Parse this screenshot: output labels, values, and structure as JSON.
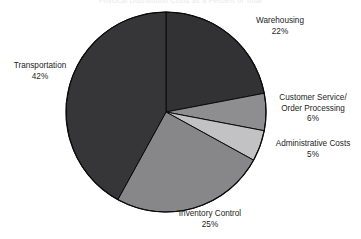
{
  "chart_data": {
    "type": "pie",
    "title": "Physical Distribution Costs as a Percent of Total",
    "xlabel": "",
    "ylabel": "",
    "legend_position": "none",
    "grid": false,
    "start_angle_deg": 0,
    "direction": "clockwise",
    "categories": [
      "Warehousing",
      "Customer Service/ Order Processing",
      "Administrative Costs",
      "Inventory Control",
      "Transportation"
    ],
    "values": [
      22,
      6,
      5,
      25,
      42
    ],
    "value_unit": "%",
    "slices": [
      {
        "name": "warehousing",
        "label_lines": [
          "Warehousing"
        ],
        "value_text": "22%",
        "value": 22,
        "color": "#323234",
        "start_pct": 0,
        "end_pct": 22
      },
      {
        "name": "customer-service-order-processing",
        "label_lines": [
          "Customer Service/",
          "Order Processing"
        ],
        "value_text": "6%",
        "value": 6,
        "color": "#8e8e90",
        "start_pct": 22,
        "end_pct": 28
      },
      {
        "name": "administrative-costs",
        "label_lines": [
          "Administrative Costs"
        ],
        "value_text": "5%",
        "value": 5,
        "color": "#c2c2c4",
        "start_pct": 28,
        "end_pct": 33
      },
      {
        "name": "inventory-control",
        "label_lines": [
          "Inventory Control"
        ],
        "value_text": "25%",
        "value": 25,
        "color": "#878789",
        "start_pct": 33,
        "end_pct": 58
      },
      {
        "name": "transportation",
        "label_lines": [
          "Transportation"
        ],
        "value_text": "42%",
        "value": 42,
        "color": "#363638",
        "start_pct": 58,
        "end_pct": 100
      }
    ],
    "outline_color": "#0a0a0a",
    "background_color": "#ffffff",
    "geometry": {
      "cx": 166,
      "cy": 112,
      "r": 100
    }
  },
  "labels": {
    "warehousing": {
      "line1": "Warehousing",
      "value": "22%"
    },
    "customer_service": {
      "line1": "Customer Service/",
      "line2": "Order Processing",
      "value": "6%"
    },
    "administrative_costs": {
      "line1": "Administrative Costs",
      "value": "5%"
    },
    "transportation": {
      "line1": "Transportation",
      "value": "42%"
    },
    "inventory_control": {
      "line1": "Inventory Control",
      "value": "25%"
    }
  }
}
